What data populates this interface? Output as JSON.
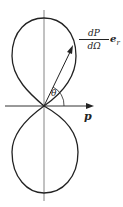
{
  "figure": {
    "vector_label": {
      "numerator": "dP",
      "denominator": "dΩ",
      "unit_vector": "e",
      "unit_vector_sub": "r"
    },
    "angle_label": "θ",
    "axis_label": "p",
    "colors": {
      "stroke": "#222222",
      "axis": "#555555"
    }
  }
}
